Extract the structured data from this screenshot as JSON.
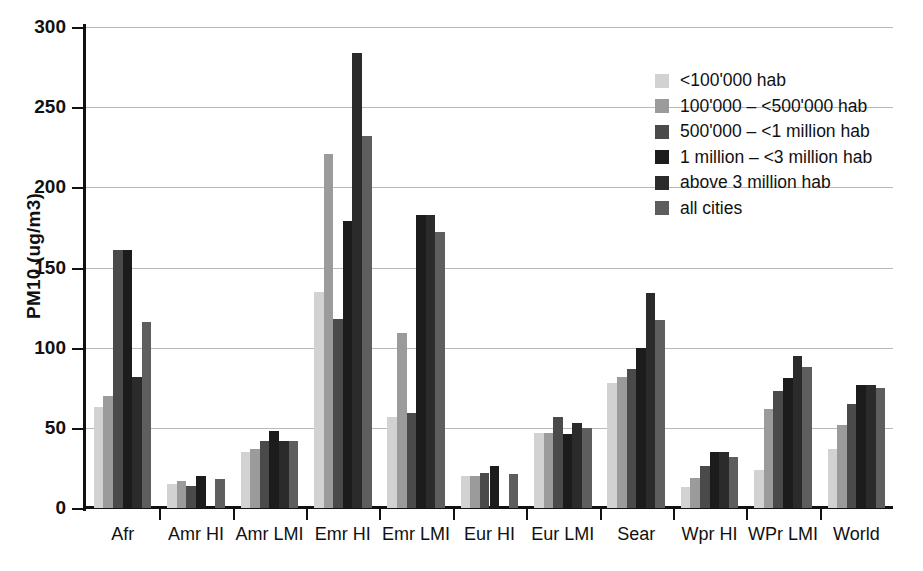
{
  "chart_data": {
    "type": "bar",
    "title": "",
    "xlabel": "",
    "ylabel": "PM10 (ug/m3)",
    "ylim": [
      0,
      300
    ],
    "yticks": [
      0,
      50,
      100,
      150,
      200,
      250,
      300
    ],
    "grid": true,
    "legend_position": "top-right",
    "categories": [
      "Afr",
      "Amr HI",
      "Amr LMI",
      "Emr HI",
      "Emr LMI",
      "Eur HI",
      "Eur LMI",
      "Sear",
      "Wpr HI",
      "WPr LMI",
      "World"
    ],
    "series": [
      {
        "name": "<100'000 hab",
        "color": "#d2d2d2",
        "values": [
          63,
          15,
          35,
          135,
          57,
          20,
          47,
          78,
          13,
          24,
          37
        ]
      },
      {
        "name": "100'000 – <500'000 hab",
        "color": "#9b9b9b",
        "values": [
          70,
          17,
          37,
          221,
          109,
          20,
          47,
          82,
          19,
          62,
          52
        ]
      },
      {
        "name": "500'000 – <1 million hab",
        "color": "#4a4a4a",
        "values": [
          161,
          14,
          42,
          118,
          59,
          22,
          57,
          87,
          26,
          73,
          65
        ]
      },
      {
        "name": "1 million – <3 million hab",
        "color": "#1c1c1c",
        "values": [
          161,
          20,
          48,
          179,
          183,
          26,
          46,
          100,
          35,
          81,
          77
        ]
      },
      {
        "name": "above 3 million hab",
        "color": "#2b2b2b",
        "values": [
          82,
          0,
          42,
          284,
          183,
          0,
          53,
          134,
          35,
          95,
          77
        ]
      },
      {
        "name": "all cities",
        "color": "#5e5e5e",
        "values": [
          116,
          18,
          42,
          232,
          172,
          21,
          50,
          117,
          32,
          88,
          75
        ]
      }
    ]
  },
  "axis": {
    "y_title": "PM10 (ug/m3)",
    "y_tick_labels": [
      "0",
      "50",
      "100",
      "150",
      "200",
      "250",
      "300"
    ]
  },
  "legend": {
    "items": [
      {
        "label": "<100'000 hab",
        "color": "#d2d2d2"
      },
      {
        "label": "100'000 – <500'000 hab",
        "color": "#9b9b9b"
      },
      {
        "label": "500'000 – <1 million hab",
        "color": "#4a4a4a"
      },
      {
        "label": "1 million – <3 million hab",
        "color": "#1c1c1c"
      },
      {
        "label": "above 3 million hab",
        "color": "#2b2b2b"
      },
      {
        "label": "all cities",
        "color": "#5e5e5e"
      }
    ]
  }
}
